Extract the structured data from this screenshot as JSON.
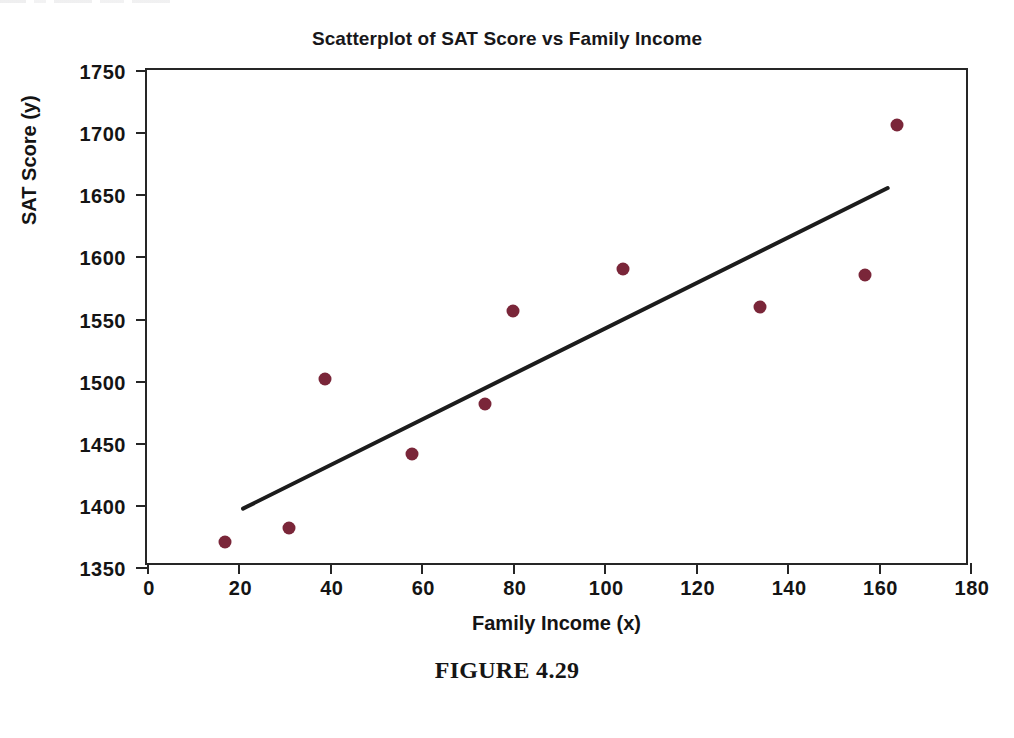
{
  "chart_data": {
    "type": "scatter",
    "title": "Scatterplot of SAT Score vs Family Income",
    "xlabel": "Family Income (x)",
    "ylabel": "SAT Score (y)",
    "xlim": [
      0,
      180
    ],
    "ylim": [
      1350,
      1750
    ],
    "xticks": [
      0,
      20,
      40,
      60,
      80,
      100,
      120,
      140,
      160,
      180
    ],
    "yticks": [
      1350,
      1400,
      1450,
      1500,
      1550,
      1600,
      1650,
      1700,
      1750
    ],
    "grid": false,
    "legend": "none",
    "point_color": "#7a2639",
    "line_color": "#1c1c1c",
    "points": [
      {
        "x": 17,
        "y": 1370
      },
      {
        "x": 31,
        "y": 1381
      },
      {
        "x": 39,
        "y": 1501
      },
      {
        "x": 58,
        "y": 1441
      },
      {
        "x": 74,
        "y": 1481
      },
      {
        "x": 80,
        "y": 1556
      },
      {
        "x": 104,
        "y": 1590
      },
      {
        "x": 134,
        "y": 1559
      },
      {
        "x": 157,
        "y": 1585
      },
      {
        "x": 164,
        "y": 1706
      }
    ],
    "trendline": {
      "type": "linear-fit",
      "x_start": 21,
      "y_start": 1397,
      "x_end": 162,
      "y_end": 1655
    }
  },
  "caption": {
    "text": "FIGURE 4.29"
  }
}
